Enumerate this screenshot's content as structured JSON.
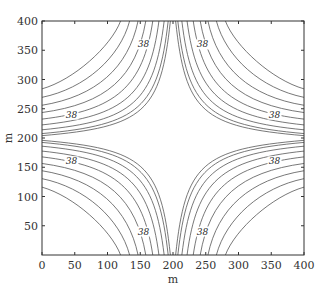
{
  "chart_data": {
    "type": "contour",
    "title": "",
    "xlabel": "m",
    "ylabel": "m",
    "xlim": [
      0,
      400
    ],
    "ylim": [
      0,
      400
    ],
    "xticks": [
      0,
      50,
      100,
      150,
      200,
      250,
      300,
      350,
      400
    ],
    "yticks": [
      50,
      100,
      150,
      200,
      250,
      300,
      350,
      400
    ],
    "grid": false,
    "contour_label": "38",
    "contour_levels_per_quadrant": 9,
    "symmetry_center": [
      200,
      200
    ],
    "contour_label_positions": [
      [
        155,
        360
      ],
      [
        45,
        240
      ],
      [
        245,
        360
      ],
      [
        355,
        240
      ],
      [
        45,
        160
      ],
      [
        155,
        40
      ],
      [
        355,
        160
      ],
      [
        245,
        40
      ]
    ],
    "line_color": "#555555"
  }
}
